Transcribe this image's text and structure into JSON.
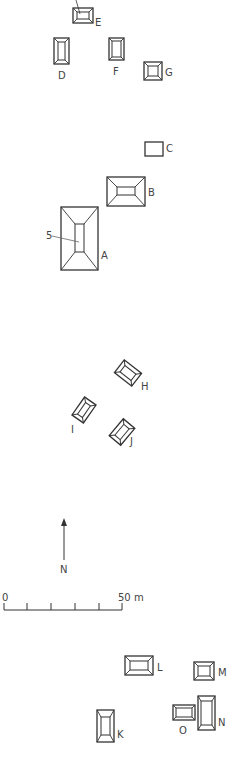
{
  "map": {
    "stroke_color": "#333333",
    "label_color": "#444444",
    "structures": [
      {
        "id": "E",
        "label": "E",
        "x": 73,
        "y": 8,
        "w": 20,
        "h": 15,
        "inner": [
          4,
          4,
          12,
          7
        ],
        "label_pos": [
          95,
          18
        ]
      },
      {
        "id": "D",
        "label": "D",
        "x": 54,
        "y": 38,
        "w": 15,
        "h": 26,
        "inner": [
          4,
          4,
          7,
          18
        ],
        "label_pos": [
          58,
          71
        ]
      },
      {
        "id": "F",
        "label": "F",
        "x": 109,
        "y": 38,
        "w": 15,
        "h": 22,
        "inner": [
          3,
          3,
          9,
          16
        ],
        "label_pos": [
          113,
          67
        ]
      },
      {
        "id": "G",
        "label": "G",
        "x": 144,
        "y": 62,
        "w": 18,
        "h": 18,
        "inner": [
          4,
          4,
          10,
          10
        ],
        "label_pos": [
          165,
          68
        ]
      },
      {
        "id": "C",
        "label": "C",
        "x": 145,
        "y": 142,
        "w": 18,
        "h": 14,
        "inner": null,
        "label_pos": [
          166,
          144
        ]
      },
      {
        "id": "B",
        "label": "B",
        "x": 107,
        "y": 177,
        "w": 38,
        "h": 29,
        "inner": [
          10,
          10,
          18,
          8
        ],
        "label_pos": [
          148,
          188
        ]
      },
      {
        "id": "A",
        "label": "A",
        "x": 61,
        "y": 207,
        "w": 37,
        "h": 63,
        "inner": [
          14,
          17,
          9,
          28
        ],
        "label_pos": [
          101,
          251
        ]
      }
    ],
    "rotated_structures": [
      {
        "id": "H",
        "label": "H",
        "cx": 128,
        "cy": 373,
        "w": 22,
        "h": 16,
        "angle": 38,
        "label_pos": [
          141,
          382
        ]
      },
      {
        "id": "I",
        "label": "I",
        "cx": 84,
        "cy": 410,
        "w": 22,
        "h": 14,
        "angle": -55,
        "label_pos": [
          71,
          425
        ]
      },
      {
        "id": "J",
        "label": "J",
        "cx": 122,
        "cy": 432,
        "w": 22,
        "h": 15,
        "angle": -50,
        "label_pos": [
          130,
          437
        ]
      }
    ],
    "lower_structures": [
      {
        "id": "L",
        "label": "L",
        "x": 125,
        "y": 656,
        "w": 28,
        "h": 19,
        "inner": [
          5,
          5,
          18,
          9
        ],
        "label_pos": [
          157,
          663
        ]
      },
      {
        "id": "M",
        "label": "M",
        "x": 194,
        "y": 662,
        "w": 20,
        "h": 18,
        "inner": [
          4,
          4,
          12,
          10
        ],
        "label_pos": [
          218,
          668
        ]
      },
      {
        "id": "N",
        "label": "N",
        "x": 198,
        "y": 696,
        "w": 17,
        "h": 34,
        "inner": [
          3,
          5,
          11,
          24
        ],
        "label_pos": [
          218,
          718
        ]
      },
      {
        "id": "O",
        "label": "O",
        "x": 173,
        "y": 705,
        "w": 22,
        "h": 15,
        "inner": [
          3,
          3,
          16,
          9
        ],
        "label_pos": [
          179,
          726
        ]
      },
      {
        "id": "K",
        "label": "K",
        "x": 97,
        "y": 710,
        "w": 17,
        "h": 32,
        "inner": [
          4,
          7,
          9,
          18
        ],
        "label_pos": [
          117,
          730
        ]
      }
    ],
    "feature_label": {
      "text": "5",
      "x": 46,
      "y": 231
    },
    "north_arrow": {
      "label": "N",
      "x": 64,
      "y": 518,
      "length": 42,
      "label_pos": [
        60,
        565
      ]
    },
    "scale_bar": {
      "start_label": "0",
      "end_label": "50 m",
      "x0": 4,
      "x1": 122,
      "y": 610,
      "ticks": [
        4,
        27,
        51,
        75,
        99,
        122
      ]
    }
  }
}
